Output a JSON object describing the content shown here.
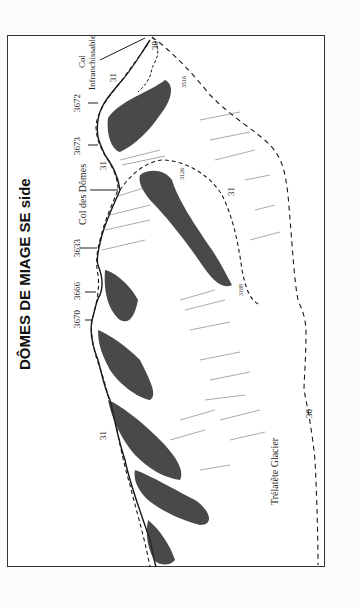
{
  "title": "DÔMES DE MIAGE  SE side",
  "summits": [
    {
      "label": "3670"
    },
    {
      "label": "3666"
    },
    {
      "label": "3633"
    },
    {
      "label": "Col des Dômes"
    },
    {
      "label": "3673"
    },
    {
      "label": "3672"
    }
  ],
  "col_label": {
    "line1": "Col",
    "line2": "Infranchissable"
  },
  "route_numbers": {
    "r31a": "31",
    "r31b": "31",
    "r31c": "31",
    "r31d": "31",
    "r30a": "30",
    "r30b": "30"
  },
  "spot_heights": {
    "h1": "3516",
    "h2": "3126",
    "h3": "3189"
  },
  "glacier_label": "Trélatête  Glacier",
  "colors": {
    "ink": "#1a1a1a",
    "paper": "#ffffff",
    "background": "#fbfbfa"
  }
}
